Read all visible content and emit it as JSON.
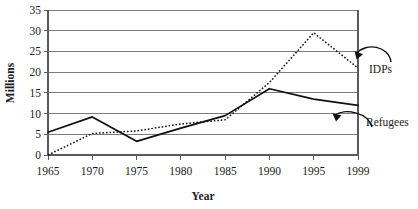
{
  "chart_data": {
    "type": "line",
    "title": "",
    "xlabel": "Year",
    "ylabel": "Millions",
    "x": [
      1965,
      1970,
      1975,
      1980,
      1985,
      1990,
      1995,
      1999
    ],
    "xtick_labels": [
      "1965",
      "1970",
      "1975",
      "1980",
      "1985",
      "1990",
      "1995",
      "1999"
    ],
    "ytick_labels": [
      "0",
      "5",
      "10",
      "15",
      "20",
      "25",
      "30",
      "35"
    ],
    "yticks": [
      0,
      5,
      10,
      15,
      20,
      25,
      30,
      35
    ],
    "ylim": [
      0,
      35
    ],
    "grid": true,
    "legend_position": "inline-annotations",
    "series": [
      {
        "name": "Refugees",
        "style": "solid",
        "values": [
          5.5,
          9.2,
          3.3,
          6.5,
          9.5,
          16.0,
          13.5,
          12.0
        ]
      },
      {
        "name": "IDPs",
        "style": "dotted",
        "values": [
          0.0,
          5.2,
          5.8,
          7.5,
          8.5,
          17.5,
          29.5,
          21.0
        ]
      }
    ],
    "annotations": [
      {
        "label": "IDPs",
        "points_to_series": "IDPs",
        "points_to_x": 1997
      },
      {
        "label": "Refugees",
        "points_to_series": "Refugees",
        "points_to_x": 1997
      }
    ]
  },
  "axis": {
    "y_title": "Millions",
    "x_title": "Year"
  }
}
